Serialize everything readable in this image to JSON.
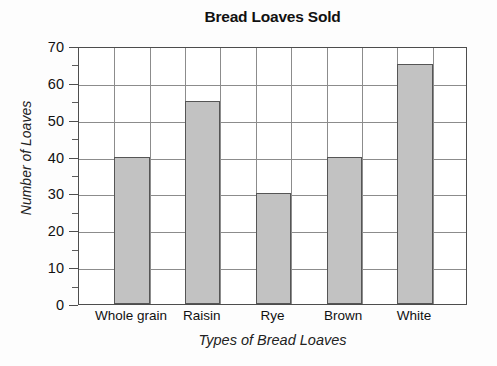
{
  "chart_data": {
    "type": "bar",
    "title": "Bread Loaves Sold",
    "xlabel": "Types of Bread Loaves",
    "ylabel": "Number of Loaves",
    "categories": [
      "Whole grain",
      "Raisin",
      "Rye",
      "Brown",
      "White"
    ],
    "values": [
      40,
      55,
      30,
      40,
      65
    ],
    "ylim": [
      0,
      70
    ],
    "ytick_labels": [
      "0",
      "10",
      "20",
      "30",
      "40",
      "50",
      "60",
      "70"
    ],
    "ytick_values": [
      0,
      10,
      20,
      30,
      40,
      50,
      60,
      70
    ],
    "y_minor_ticks": [
      5,
      15,
      25,
      35,
      45,
      55,
      65
    ],
    "y_major_step": 10,
    "y_minor_step": 5,
    "grid": "both",
    "legend": "none",
    "bar_fill_color": "#c2c2c2",
    "bar_border_color": "#555555",
    "grid_color": "#8c8c8c",
    "axis_color": "#4d4d4d",
    "background_color": "#fdfdfd",
    "plot_background_color": "#ffffff",
    "vertical_grid_columns": 11,
    "bar_columns": [
      1,
      3,
      5,
      7,
      9
    ]
  }
}
